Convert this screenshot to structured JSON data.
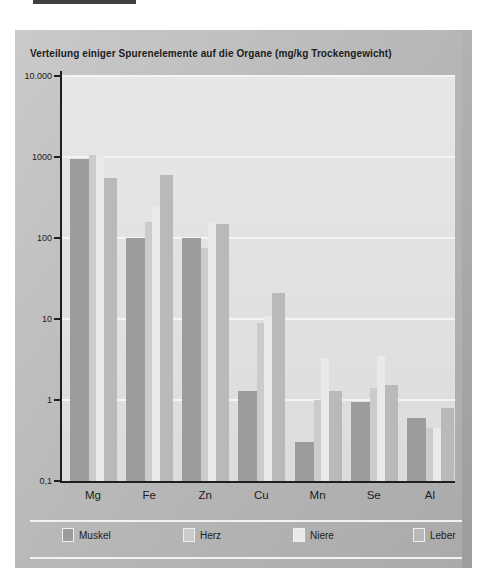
{
  "figure": {
    "title": "Verteilung einiger Spurenelemente auf die Organe (mg/kg Trockengewicht)"
  },
  "chart_data": {
    "type": "bar",
    "title": "Verteilung einiger Spurenelemente auf die Organe (mg/kg Trockengewicht)",
    "categories": [
      "Mg",
      "Fe",
      "Zn",
      "Cu",
      "Mn",
      "Se",
      "Al"
    ],
    "series": [
      {
        "name": "Muskel",
        "color_key": "muskel",
        "values": [
          950,
          100,
          100,
          1.3,
          0.3,
          0.95,
          0.6
        ]
      },
      {
        "name": "Herz",
        "color_key": "herz",
        "values": [
          1050,
          160,
          75,
          9,
          1.0,
          1.4,
          0.45
        ]
      },
      {
        "name": "Niere",
        "color_key": "niere",
        "values": [
          1050,
          250,
          160,
          11,
          3.3,
          3.5,
          0.45
        ]
      },
      {
        "name": "Leber",
        "color_key": "leber",
        "values": [
          550,
          600,
          150,
          21,
          1.3,
          1.55,
          0.8
        ]
      }
    ],
    "y_axis": {
      "scale": "log",
      "min": 0.1,
      "max": 10000,
      "tick_labels": [
        "10.000",
        "1000",
        "100",
        "10",
        "1",
        "0,1"
      ],
      "grid": "horizontal-white-lines"
    },
    "legend": {
      "position": "bottom",
      "entries": [
        "Muskel",
        "Herz",
        "Niere",
        "Leber"
      ]
    }
  },
  "colors": {
    "muskel": "#9c9c9c",
    "herz": "#cbcbcb",
    "niere": "#e9e9e9",
    "leber": "#b9b9b9",
    "axis": "#1f1f1f",
    "grid": "#f4f4f4",
    "panel": "#b9b9b9",
    "plot_bg": "#e0e0e0"
  }
}
